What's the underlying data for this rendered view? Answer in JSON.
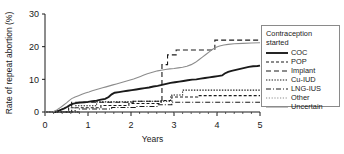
{
  "figure": {
    "background": "#ffffff"
  },
  "legend": {
    "title_line1": "Contraception",
    "title_line2": "started",
    "entries": [
      {
        "label": "COC",
        "color": "#1a1a1a",
        "dash": "none",
        "width": 1.9
      },
      {
        "label": "POP",
        "color": "#1a1a1a",
        "dash": "3,2",
        "width": 1.1
      },
      {
        "label": "Implant",
        "color": "#1a1a1a",
        "dash": "5,3",
        "width": 1.1
      },
      {
        "label": "Cu-IUD",
        "color": "#1a1a1a",
        "dash": "1.4,1.4",
        "width": 1.1
      },
      {
        "label": "LNG-IUS",
        "color": "#1a1a1a",
        "dash": "5,2,1,2",
        "width": 1.1
      },
      {
        "label": "Other",
        "color": "#8c8c8c",
        "dash": "1.2,1.6",
        "width": 1.1
      },
      {
        "label": "Uncertain",
        "color": "#8c8c8c",
        "dash": "none",
        "width": 1.1
      }
    ]
  },
  "chart_data": {
    "type": "line",
    "title": "",
    "xlabel": "Years",
    "ylabel": "Rate of repeat abortion (%)",
    "xlim": [
      0,
      5
    ],
    "ylim": [
      0,
      30
    ],
    "xticks": [
      0,
      1,
      2,
      3,
      4,
      5
    ],
    "yticks": [
      0,
      10,
      20,
      30
    ],
    "xtick_labels": [
      "0",
      "1",
      "2",
      "3",
      "4",
      "5"
    ],
    "ytick_labels": [
      "0",
      "10",
      "20",
      "30"
    ],
    "grid": false,
    "legend_position": "right-outside",
    "note": "Kaplan-Meier style cumulative step curves; values are cumulative percent.",
    "series": [
      {
        "name": "COC",
        "color": "#1a1a1a",
        "dash": "none",
        "width": 1.9,
        "points": [
          [
            0.0,
            0.0
          ],
          [
            0.22,
            0.0
          ],
          [
            0.3,
            0.3
          ],
          [
            0.38,
            0.7
          ],
          [
            0.45,
            1.1
          ],
          [
            0.52,
            1.6
          ],
          [
            0.58,
            2.1
          ],
          [
            0.64,
            2.5
          ],
          [
            0.72,
            2.7
          ],
          [
            0.82,
            2.9
          ],
          [
            0.92,
            3.0
          ],
          [
            1.0,
            3.1
          ],
          [
            1.1,
            3.3
          ],
          [
            1.2,
            3.5
          ],
          [
            1.3,
            3.8
          ],
          [
            1.4,
            4.0
          ],
          [
            1.48,
            4.6
          ],
          [
            1.55,
            5.4
          ],
          [
            1.62,
            5.9
          ],
          [
            1.72,
            6.1
          ],
          [
            1.82,
            6.3
          ],
          [
            1.92,
            6.5
          ],
          [
            2.02,
            6.7
          ],
          [
            2.12,
            6.9
          ],
          [
            2.22,
            7.1
          ],
          [
            2.32,
            7.3
          ],
          [
            2.42,
            7.5
          ],
          [
            2.52,
            7.8
          ],
          [
            2.62,
            8.0
          ],
          [
            2.72,
            8.3
          ],
          [
            2.82,
            8.6
          ],
          [
            2.92,
            8.9
          ],
          [
            3.02,
            9.1
          ],
          [
            3.12,
            9.3
          ],
          [
            3.22,
            9.5
          ],
          [
            3.32,
            9.7
          ],
          [
            3.42,
            9.9
          ],
          [
            3.52,
            10.0
          ],
          [
            3.62,
            10.2
          ],
          [
            3.72,
            10.4
          ],
          [
            3.82,
            10.6
          ],
          [
            3.92,
            10.8
          ],
          [
            4.02,
            11.0
          ],
          [
            4.12,
            11.2
          ],
          [
            4.18,
            11.8
          ],
          [
            4.26,
            12.3
          ],
          [
            4.34,
            12.6
          ],
          [
            4.44,
            12.9
          ],
          [
            4.54,
            13.2
          ],
          [
            4.64,
            13.5
          ],
          [
            4.74,
            13.8
          ],
          [
            4.84,
            14.0
          ],
          [
            4.94,
            14.1
          ],
          [
            5.0,
            14.2
          ]
        ]
      },
      {
        "name": "POP",
        "color": "#1a1a1a",
        "dash": "3,2",
        "width": 1.1,
        "points": [
          [
            0.0,
            0.0
          ],
          [
            0.55,
            0.0
          ],
          [
            0.55,
            1.3
          ],
          [
            1.3,
            1.3
          ],
          [
            1.3,
            2.0
          ],
          [
            1.95,
            2.0
          ],
          [
            1.95,
            2.6
          ],
          [
            2.7,
            2.6
          ],
          [
            2.7,
            3.5
          ],
          [
            2.92,
            3.5
          ],
          [
            2.92,
            4.6
          ],
          [
            3.55,
            4.6
          ],
          [
            3.55,
            5.0
          ],
          [
            5.0,
            5.0
          ]
        ]
      },
      {
        "name": "Implant",
        "color": "#1a1a1a",
        "dash": "5,3",
        "width": 1.1,
        "points": [
          [
            0.0,
            0.0
          ],
          [
            0.62,
            0.0
          ],
          [
            0.62,
            3.0
          ],
          [
            2.05,
            3.0
          ],
          [
            2.05,
            3.3
          ],
          [
            2.72,
            3.3
          ],
          [
            2.72,
            14.5
          ],
          [
            2.85,
            14.5
          ],
          [
            2.85,
            17.5
          ],
          [
            3.05,
            17.5
          ],
          [
            3.05,
            19.0
          ],
          [
            3.95,
            19.0
          ],
          [
            3.95,
            22.0
          ],
          [
            5.0,
            22.0
          ]
        ]
      },
      {
        "name": "Cu-IUD",
        "color": "#1a1a1a",
        "dash": "1.4,1.4",
        "width": 1.1,
        "points": [
          [
            0.0,
            0.0
          ],
          [
            0.7,
            0.0
          ],
          [
            0.7,
            1.9
          ],
          [
            1.2,
            1.9
          ],
          [
            1.2,
            3.1
          ],
          [
            2.05,
            3.1
          ],
          [
            2.05,
            3.3
          ],
          [
            2.95,
            3.3
          ],
          [
            2.95,
            5.2
          ],
          [
            3.2,
            5.2
          ],
          [
            3.2,
            6.7
          ],
          [
            5.0,
            6.7
          ]
        ]
      },
      {
        "name": "LNG-IUS",
        "color": "#1a1a1a",
        "dash": "5,2,1,2",
        "width": 1.1,
        "points": [
          [
            0.0,
            0.0
          ],
          [
            0.8,
            0.0
          ],
          [
            0.8,
            0.9
          ],
          [
            1.55,
            0.9
          ],
          [
            1.55,
            1.4
          ],
          [
            2.1,
            1.4
          ],
          [
            2.1,
            1.7
          ],
          [
            2.62,
            1.7
          ],
          [
            2.62,
            2.2
          ],
          [
            2.95,
            2.2
          ],
          [
            2.95,
            3.0
          ],
          [
            5.0,
            3.0
          ]
        ]
      },
      {
        "name": "Other",
        "color": "#8c8c8c",
        "dash": "1.2,1.6",
        "width": 1.1,
        "points": [
          [
            0.0,
            0.0
          ],
          [
            5.0,
            0.0
          ]
        ]
      },
      {
        "name": "Uncertain",
        "color": "#8c8c8c",
        "dash": "none",
        "width": 1.1,
        "points": [
          [
            0.0,
            0.0
          ],
          [
            0.18,
            0.0
          ],
          [
            0.26,
            0.5
          ],
          [
            0.34,
            1.2
          ],
          [
            0.42,
            2.0
          ],
          [
            0.5,
            2.8
          ],
          [
            0.56,
            3.5
          ],
          [
            0.62,
            4.1
          ],
          [
            0.7,
            4.6
          ],
          [
            0.78,
            5.0
          ],
          [
            0.86,
            5.4
          ],
          [
            0.94,
            5.8
          ],
          [
            1.02,
            6.1
          ],
          [
            1.1,
            6.5
          ],
          [
            1.18,
            6.8
          ],
          [
            1.26,
            7.1
          ],
          [
            1.34,
            7.4
          ],
          [
            1.42,
            7.7
          ],
          [
            1.5,
            8.0
          ],
          [
            1.58,
            8.3
          ],
          [
            1.66,
            8.6
          ],
          [
            1.74,
            8.9
          ],
          [
            1.82,
            9.2
          ],
          [
            1.9,
            9.5
          ],
          [
            1.98,
            9.8
          ],
          [
            2.06,
            10.1
          ],
          [
            2.14,
            10.5
          ],
          [
            2.22,
            10.9
          ],
          [
            2.3,
            11.3
          ],
          [
            2.38,
            11.7
          ],
          [
            2.46,
            12.0
          ],
          [
            2.54,
            12.3
          ],
          [
            2.62,
            12.6
          ],
          [
            2.7,
            12.8
          ],
          [
            2.8,
            13.0
          ],
          [
            2.9,
            13.2
          ],
          [
            3.0,
            13.3
          ],
          [
            3.1,
            13.5
          ],
          [
            3.2,
            13.7
          ],
          [
            3.3,
            14.0
          ],
          [
            3.4,
            14.5
          ],
          [
            3.5,
            15.2
          ],
          [
            3.58,
            16.0
          ],
          [
            3.66,
            16.8
          ],
          [
            3.74,
            17.6
          ],
          [
            3.82,
            18.4
          ],
          [
            3.9,
            19.2
          ],
          [
            3.98,
            19.8
          ],
          [
            4.06,
            20.2
          ],
          [
            4.16,
            20.5
          ],
          [
            4.26,
            20.7
          ],
          [
            4.4,
            20.9
          ],
          [
            4.6,
            21.0
          ],
          [
            4.8,
            21.1
          ],
          [
            5.0,
            21.2
          ]
        ]
      }
    ]
  }
}
